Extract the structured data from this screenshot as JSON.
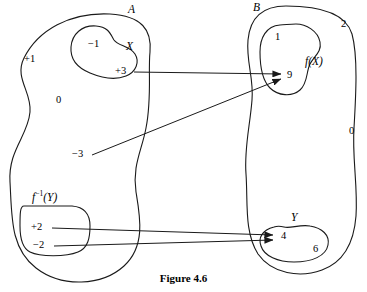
{
  "figure": {
    "caption": "Figure 4.6",
    "stroke_color": "#1a1a1a",
    "background_color": "#ffffff"
  },
  "sets": {
    "domain": {
      "label": "A",
      "elements": [
        {
          "id": "plus1",
          "label": "+1"
        },
        {
          "id": "zero",
          "label": "0"
        },
        {
          "id": "minus3",
          "label": "−3"
        }
      ]
    },
    "codomain": {
      "label": "B",
      "elements": [
        {
          "id": "two",
          "label": "2"
        },
        {
          "id": "zero_b",
          "label": "0"
        }
      ]
    }
  },
  "subsets": {
    "x": {
      "label": "X",
      "elements": [
        {
          "id": "minus1",
          "label": "−1"
        },
        {
          "id": "plus3",
          "label": "+3"
        }
      ]
    },
    "fx": {
      "label_f": "f",
      "label_open": "(",
      "label_arg": "X",
      "label_close": ")",
      "elements": [
        {
          "id": "one",
          "label": "1"
        },
        {
          "id": "nine",
          "label": "9"
        }
      ]
    },
    "finvy": {
      "label_f": "f",
      "label_sup": "−1",
      "label_open": "(",
      "label_arg": "Y",
      "label_close": ")",
      "elements": [
        {
          "id": "plus2",
          "label": "+2"
        },
        {
          "id": "minus2",
          "label": "−2"
        }
      ]
    },
    "y": {
      "label": "Y",
      "elements": [
        {
          "id": "four",
          "label": "4"
        },
        {
          "id": "six",
          "label": "6"
        }
      ]
    }
  },
  "mappings": [
    {
      "id": "map-plus3-to-9",
      "from": "+3",
      "to": "9"
    },
    {
      "id": "map-minus3-to-9",
      "from": "−3",
      "to": "9"
    },
    {
      "id": "map-plus2-to-4",
      "from": "+2",
      "to": "4"
    },
    {
      "id": "map-minus2-to-4",
      "from": "−2",
      "to": "4"
    }
  ]
}
